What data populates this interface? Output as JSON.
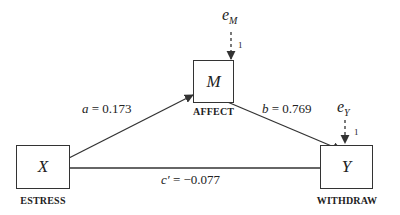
{
  "diagram": {
    "type": "mediation-model",
    "nodes": {
      "x": {
        "symbol": "X",
        "label": "ESTRESS"
      },
      "m": {
        "symbol": "M",
        "label": "AFFECT"
      },
      "y": {
        "symbol": "Y",
        "label": "WITHDRAW"
      }
    },
    "errors": {
      "m": {
        "symbol": "e",
        "subscript": "M",
        "loading": "1"
      },
      "y": {
        "symbol": "e",
        "subscript": "Y",
        "loading": "1"
      }
    },
    "paths": {
      "a": {
        "name": "a",
        "value": " = 0.173"
      },
      "b": {
        "name": "b",
        "value": " = 0.769"
      },
      "c_prime": {
        "name": "c′",
        "value": " = −0.077"
      }
    }
  }
}
